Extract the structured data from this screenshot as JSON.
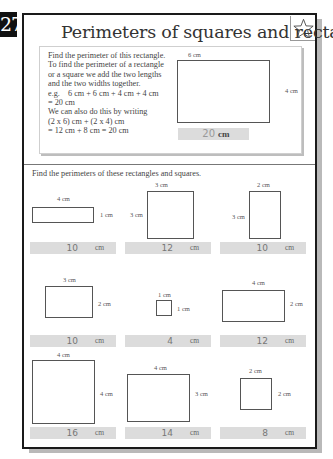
{
  "page": {
    "number": "27",
    "title": "Perimeters of squares and rectangles",
    "star_icon": "star-outline-icon"
  },
  "example": {
    "text_lines": [
      "Find the perimeter of this rectangle.",
      "To find the perimeter of a rectangle",
      "or a square we add the two lengths",
      "and the two widths together.",
      "e.g.    6 cm + 6 cm + 4 cm + 4 cm",
      "= 20 cm",
      "We can also do this by writing",
      "(2 x 6) cm + (2 x 4) cm",
      "= 12 cm + 8 cm = 20 cm"
    ],
    "shape": {
      "top_label": "6 cm",
      "side_label": "4 cm"
    },
    "answer": {
      "value": "20",
      "unit": "cm"
    }
  },
  "exercise": {
    "instructions": "Find the perimeters of these rectangles and squares.",
    "problems": [
      {
        "top_label": "4 cm",
        "side_label": "1 cm",
        "side_position": "right",
        "answer": "10",
        "unit": "cm"
      },
      {
        "top_label": "3 cm",
        "side_label": "3 cm",
        "side_position": "left",
        "answer": "12",
        "unit": "cm"
      },
      {
        "top_label": "2 cm",
        "side_label": "3 cm",
        "side_position": "left",
        "answer": "10",
        "unit": "cm"
      },
      {
        "top_label": "3 cm",
        "side_label": "2 cm",
        "side_position": "right",
        "answer": "10",
        "unit": "cm"
      },
      {
        "top_label": "1 cm",
        "side_label": "1 cm",
        "side_position": "right",
        "answer": "4",
        "unit": "cm"
      },
      {
        "top_label": "4 cm",
        "side_label": "2 cm",
        "side_position": "right",
        "answer": "12",
        "unit": "cm"
      },
      {
        "top_label": "4 cm",
        "side_label": "4 cm",
        "side_position": "right",
        "answer": "16",
        "unit": "cm"
      },
      {
        "top_label": "4 cm",
        "side_label": "3 cm",
        "side_position": "right",
        "answer": "14",
        "unit": "cm"
      },
      {
        "top_label": "2 cm",
        "side_label": "2 cm",
        "side_position": "right",
        "answer": "8",
        "unit": "cm"
      }
    ]
  }
}
